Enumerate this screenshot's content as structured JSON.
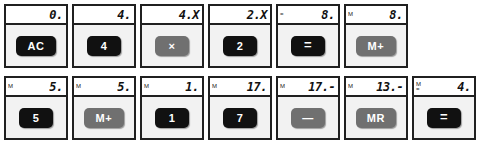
{
  "app": {
    "title": "Calculator key sequence",
    "colors": {
      "cell_border": "#202020",
      "cell_background": "#f2f2f2",
      "lcd_background": "#ffffff",
      "key_dark": "#111111",
      "key_grey": "#707070",
      "key_text": "#ffffff"
    }
  },
  "steps": [
    {
      "display_value": "0.",
      "flags": [],
      "key_label": "AC",
      "key_style": "dark",
      "key_icon": "all-clear-key"
    },
    {
      "display_value": "4.",
      "flags": [],
      "key_label": "4",
      "key_style": "dark",
      "key_icon": "digit-4-key"
    },
    {
      "display_value": "4.X",
      "flags": [],
      "key_label": "×",
      "key_style": "grey",
      "key_icon": "multiply-key"
    },
    {
      "display_value": "2.X",
      "flags": [],
      "key_label": "2",
      "key_style": "dark",
      "key_icon": "digit-2-key"
    },
    {
      "display_value": "8.",
      "flags": [
        "="
      ],
      "key_label": "=",
      "key_style": "dark",
      "key_icon": "equals-key"
    },
    {
      "display_value": "8.",
      "flags": [
        "M"
      ],
      "key_label": "M+",
      "key_style": "grey",
      "key_icon": "memory-plus-key"
    },
    {
      "display_value": "5.",
      "flags": [
        "M"
      ],
      "key_label": "5",
      "key_style": "dark",
      "key_icon": "digit-5-key"
    },
    {
      "display_value": "5.",
      "flags": [
        "M"
      ],
      "key_label": "M+",
      "key_style": "grey",
      "key_icon": "memory-plus-key"
    },
    {
      "display_value": "1.",
      "flags": [
        "M"
      ],
      "key_label": "1",
      "key_style": "dark",
      "key_icon": "digit-1-key"
    },
    {
      "display_value": "17.",
      "flags": [
        "M"
      ],
      "key_label": "7",
      "key_style": "dark",
      "key_icon": "digit-7-key"
    },
    {
      "display_value": "17.-",
      "flags": [
        "M"
      ],
      "key_label": "—",
      "key_style": "grey",
      "key_icon": "minus-key"
    },
    {
      "display_value": "13.-",
      "flags": [
        "M"
      ],
      "key_label": "MR",
      "key_style": "grey",
      "key_icon": "memory-recall-key"
    },
    {
      "display_value": "4.",
      "flags": [
        "M",
        "="
      ],
      "key_label": "=",
      "key_style": "dark",
      "key_icon": "equals-key"
    }
  ],
  "layout": {
    "rows": [
      {
        "start": 0,
        "count": 6
      },
      {
        "start": 6,
        "count": 7
      }
    ]
  }
}
